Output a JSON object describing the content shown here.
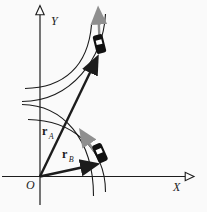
{
  "figure": {
    "type": "physics-diagram",
    "colors": {
      "background": "#fafafa",
      "ink": "#1c1c1c",
      "velocity_arrow_gray": "#8f8f8f",
      "car_body": "#111111",
      "car_window": "#ffffff"
    },
    "axes": {
      "x_label": "X",
      "y_label": "Y",
      "origin_label": "O"
    },
    "labels": {
      "vector_a": {
        "base": "r",
        "subscript": "A"
      },
      "vector_b": {
        "base": "r",
        "subscript": "B"
      }
    }
  }
}
